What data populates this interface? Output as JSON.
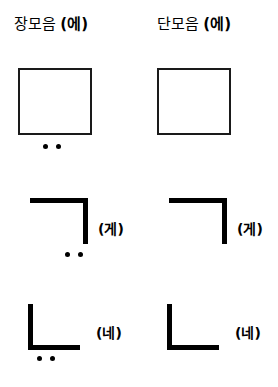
{
  "page": {
    "background_color": "#ffffff",
    "ink_color": "#000000"
  },
  "columns": [
    {
      "id": "long-vowel",
      "label": "장모음",
      "paren": "(에)",
      "mark_type": "two-dots"
    },
    {
      "id": "short-vowel",
      "label": "단모음",
      "paren": "(에)",
      "mark_type": "three-dots"
    }
  ],
  "rows": [
    {
      "id": "row-square",
      "shape": "square",
      "syllable": "",
      "left_mark": "two-dots",
      "right_mark": "three-dots"
    },
    {
      "id": "row-giyeok",
      "shape": "giyeok",
      "syllable": "(게)",
      "left_mark": "two-dots",
      "right_mark": "three-dots"
    },
    {
      "id": "row-nieun",
      "shape": "nieun",
      "syllable": "(네)",
      "left_mark": "two-dots",
      "right_mark": "three-dots"
    }
  ],
  "cells": {
    "r1c1": {
      "syllable": ""
    },
    "r1c2": {
      "syllable": ""
    },
    "r2c1": {
      "syllable": "(게)"
    },
    "r2c2": {
      "syllable": "(게)"
    },
    "r3c1": {
      "syllable": "(네)"
    },
    "r3c2": {
      "syllable": "(네)"
    }
  }
}
